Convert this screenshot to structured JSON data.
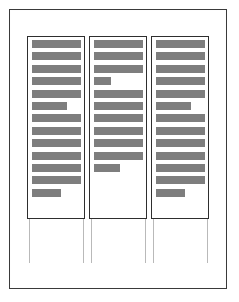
{
  "document": {
    "kind": "scanned-page-thumbnail",
    "page_label": "",
    "layout": "three-column",
    "background_color": "#ffffff",
    "border_color": "#3a3a3a",
    "text_bar_color": "#7e7e7e",
    "column_border_color": "#2e2e2e",
    "guide_line_color": "#b9b9b9"
  },
  "columns": [
    {
      "name": "column-1",
      "line_count": 13,
      "line_widths_pct": [
        100,
        100,
        100,
        100,
        100,
        72,
        100,
        100,
        100,
        100,
        100,
        100,
        60
      ],
      "trailing_blank_lines": 0
    },
    {
      "name": "column-2",
      "line_count": 11,
      "line_widths_pct": [
        100,
        100,
        100,
        35,
        100,
        100,
        100,
        100,
        100,
        100,
        55
      ],
      "trailing_blank_lines": 2
    },
    {
      "name": "column-3",
      "line_count": 13,
      "line_widths_pct": [
        100,
        100,
        100,
        100,
        100,
        72,
        100,
        100,
        100,
        100,
        100,
        100,
        60
      ],
      "trailing_blank_lines": 0
    }
  ],
  "guides": [
    {
      "name": "guide-column-1-left"
    },
    {
      "name": "guide-column-1-right"
    },
    {
      "name": "guide-column-2-left"
    },
    {
      "name": "guide-column-2-right"
    },
    {
      "name": "guide-column-3-left"
    },
    {
      "name": "guide-column-3-right"
    }
  ]
}
